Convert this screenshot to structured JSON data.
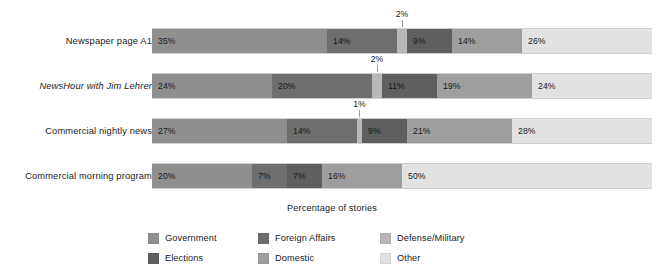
{
  "chart_data": {
    "type": "bar",
    "orientation": "horizontal",
    "stacked": true,
    "normalized_percent": true,
    "title": "",
    "xlabel": "Percentage of stories",
    "ylabel": "",
    "xlim": [
      0,
      100
    ],
    "grid": false,
    "legend_position": "bottom",
    "categories": [
      "Newspaper page A1",
      "NewsHour with Jim Lehrer",
      "Commercial nightly news",
      "Commercial morning program"
    ],
    "category_styles": [
      "normal",
      "italic",
      "normal",
      "normal"
    ],
    "series": [
      {
        "name": "Government",
        "color": "#8f8f8f",
        "values": [
          35,
          24,
          27,
          20
        ]
      },
      {
        "name": "Foreign Affairs",
        "color": "#6e6e6e",
        "values": [
          14,
          20,
          14,
          7
        ]
      },
      {
        "name": "Defense/Military",
        "color": "#b7b7b7",
        "values": [
          2,
          2,
          1,
          0
        ]
      },
      {
        "name": "Elections",
        "color": "#5f5f5f",
        "values": [
          9,
          11,
          9,
          7
        ]
      },
      {
        "name": "Domestic",
        "color": "#9e9e9e",
        "values": [
          14,
          19,
          21,
          16
        ]
      },
      {
        "name": "Other",
        "color": "#e2e2e2",
        "values": [
          26,
          24,
          28,
          50
        ]
      }
    ],
    "bars": [
      {
        "category": "Newspaper page A1",
        "segments": [
          {
            "series": "Government",
            "value": 35,
            "label": "35%",
            "label_placement": "inside"
          },
          {
            "series": "Foreign Affairs",
            "value": 14,
            "label": "14%",
            "label_placement": "inside"
          },
          {
            "series": "Defense/Military",
            "value": 2,
            "label": "2%",
            "label_placement": "callout-above"
          },
          {
            "series": "Elections",
            "value": 9,
            "label": "9%",
            "label_placement": "inside"
          },
          {
            "series": "Domestic",
            "value": 14,
            "label": "14%",
            "label_placement": "inside"
          },
          {
            "series": "Other",
            "value": 26,
            "label": "26%",
            "label_placement": "inside"
          }
        ]
      },
      {
        "category": "NewsHour with Jim Lehrer",
        "segments": [
          {
            "series": "Government",
            "value": 24,
            "label": "24%",
            "label_placement": "inside"
          },
          {
            "series": "Foreign Affairs",
            "value": 20,
            "label": "20%",
            "label_placement": "inside"
          },
          {
            "series": "Defense/Military",
            "value": 2,
            "label": "2%",
            "label_placement": "callout-above"
          },
          {
            "series": "Elections",
            "value": 11,
            "label": "11%",
            "label_placement": "inside"
          },
          {
            "series": "Domestic",
            "value": 19,
            "label": "19%",
            "label_placement": "inside"
          },
          {
            "series": "Other",
            "value": 24,
            "label": "24%",
            "label_placement": "inside"
          }
        ]
      },
      {
        "category": "Commercial nightly news",
        "segments": [
          {
            "series": "Government",
            "value": 27,
            "label": "27%",
            "label_placement": "inside"
          },
          {
            "series": "Foreign Affairs",
            "value": 14,
            "label": "14%",
            "label_placement": "inside"
          },
          {
            "series": "Defense/Military",
            "value": 1,
            "label": "1%",
            "label_placement": "callout-above"
          },
          {
            "series": "Elections",
            "value": 9,
            "label": "9%",
            "label_placement": "inside"
          },
          {
            "series": "Domestic",
            "value": 21,
            "label": "21%",
            "label_placement": "inside"
          },
          {
            "series": "Other",
            "value": 28,
            "label": "28%",
            "label_placement": "inside"
          }
        ]
      },
      {
        "category": "Commercial morning program",
        "segments": [
          {
            "series": "Government",
            "value": 20,
            "label": "20%",
            "label_placement": "inside"
          },
          {
            "series": "Foreign Affairs",
            "value": 7,
            "label": "7%",
            "label_placement": "inside"
          },
          {
            "series": "Elections",
            "value": 7,
            "label": "7%",
            "label_placement": "inside"
          },
          {
            "series": "Domestic",
            "value": 16,
            "label": "16%",
            "label_placement": "inside"
          },
          {
            "series": "Other",
            "value": 50,
            "label": "50%",
            "label_placement": "inside"
          }
        ]
      }
    ],
    "legend": [
      {
        "label": "Government",
        "color": "#8f8f8f"
      },
      {
        "label": "Foreign Affairs",
        "color": "#6e6e6e"
      },
      {
        "label": "Defense/Military",
        "color": "#b7b7b7"
      },
      {
        "label": "Elections",
        "color": "#5f5f5f"
      },
      {
        "label": "Domestic",
        "color": "#9e9e9e"
      },
      {
        "label": "Other",
        "color": "#e2e2e2"
      }
    ]
  },
  "layout": {
    "plot_left_px": 152,
    "plot_width_px": 500,
    "bar_height_px": 26,
    "row_tops_px": [
      28,
      73,
      118,
      163
    ]
  }
}
